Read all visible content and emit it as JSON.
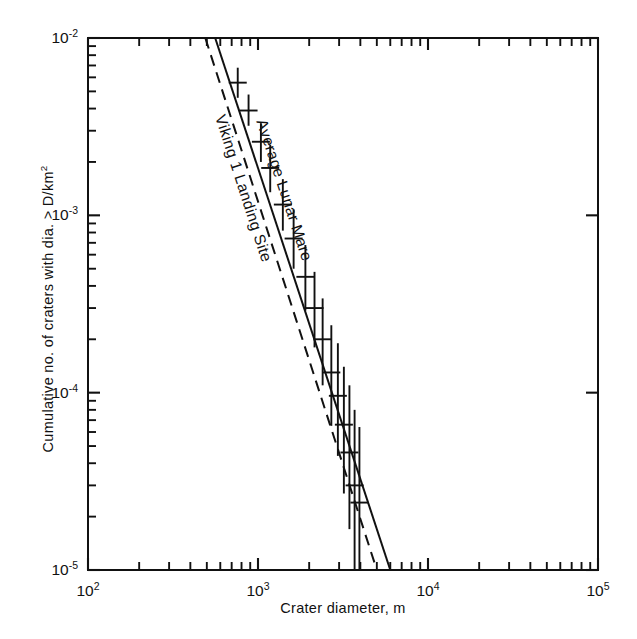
{
  "chart_data": {
    "type": "line",
    "title": "",
    "xlabel": "Crater diameter, m",
    "ylabel": "Cumulative no. of craters with dia. > D/km",
    "ylabel_sup": "2",
    "xscale": "log",
    "yscale": "log",
    "xlim": [
      100,
      100000
    ],
    "ylim": [
      1e-05,
      0.01
    ],
    "grid": false,
    "legend_position": "inline-curve-labels",
    "xticks": [
      {
        "value": 100,
        "label": "10",
        "exp": "2",
        "major": true
      },
      {
        "value": 1000,
        "label": "10",
        "exp": "3",
        "major": true
      },
      {
        "value": 10000,
        "label": "10",
        "exp": "4",
        "major": true
      },
      {
        "value": 100000,
        "label": "10",
        "exp": "5",
        "major": true
      }
    ],
    "yticks": [
      {
        "value": 0.01,
        "label": "10",
        "exp": "-2",
        "major": true
      },
      {
        "value": 0.001,
        "label": "10",
        "exp": "-3",
        "major": true
      },
      {
        "value": 0.0001,
        "label": "10",
        "exp": "-4",
        "major": true
      },
      {
        "value": 1e-05,
        "label": "10",
        "exp": "-5",
        "major": true
      }
    ],
    "minor_tick_multipliers": [
      2,
      3,
      4,
      5,
      6,
      7,
      8,
      9
    ],
    "series": [
      {
        "name": "Average Lunar Mare",
        "style": "solid",
        "annotation": "Average Lunar Mare",
        "x": [
          560,
          6000
        ],
        "y": [
          0.01,
          1e-05
        ]
      },
      {
        "name": "Viking 1 Landing Site",
        "style": "dashed",
        "annotation": "Viking 1 Landing Site",
        "x": [
          490,
          5000
        ],
        "y": [
          0.01,
          1e-05
        ]
      }
    ],
    "points": [
      {
        "x": 760,
        "y": 0.0056,
        "yerr_low": 0.0046,
        "yerr_high": 0.0068
      },
      {
        "x": 880,
        "y": 0.0039,
        "yerr_low": 0.0032,
        "yerr_high": 0.0048
      },
      {
        "x": 1040,
        "y": 0.0026,
        "yerr_low": 0.002,
        "yerr_high": 0.0033
      },
      {
        "x": 1180,
        "y": 0.00185,
        "yerr_low": 0.00135,
        "yerr_high": 0.0025
      },
      {
        "x": 1400,
        "y": 0.00115,
        "yerr_low": 0.00082,
        "yerr_high": 0.0016
      },
      {
        "x": 1620,
        "y": 0.00074,
        "yerr_low": 0.0005,
        "yerr_high": 0.00108
      },
      {
        "x": 1900,
        "y": 0.00045,
        "yerr_low": 0.00029,
        "yerr_high": 0.00068
      },
      {
        "x": 2150,
        "y": 0.0003,
        "yerr_low": 0.00018,
        "yerr_high": 0.00048
      },
      {
        "x": 2400,
        "y": 0.0002,
        "yerr_low": 0.00011,
        "yerr_high": 0.00034
      },
      {
        "x": 2700,
        "y": 0.00013,
        "yerr_low": 6.5e-05,
        "yerr_high": 0.00024
      },
      {
        "x": 2950,
        "y": 9.6e-05,
        "yerr_low": 4.4e-05,
        "yerr_high": 0.00019
      },
      {
        "x": 3200,
        "y": 6.6e-05,
        "yerr_low": 2.7e-05,
        "yerr_high": 0.00014
      },
      {
        "x": 3450,
        "y": 4.6e-05,
        "yerr_low": 1.7e-05,
        "yerr_high": 0.00011
      },
      {
        "x": 3700,
        "y": 3e-05,
        "yerr_low": 1e-05,
        "yerr_high": 8e-05
      },
      {
        "x": 3950,
        "y": 2.4e-05,
        "yerr_low": 1e-05,
        "yerr_high": 6.4e-05
      }
    ]
  },
  "axes": {
    "x_title": "Crater diameter, m",
    "y_title_main": "Cumulative no. of craters with dia. > D/km",
    "y_title_exp": "2"
  },
  "colors": {
    "ink": "#111111",
    "background": "#ffffff"
  }
}
